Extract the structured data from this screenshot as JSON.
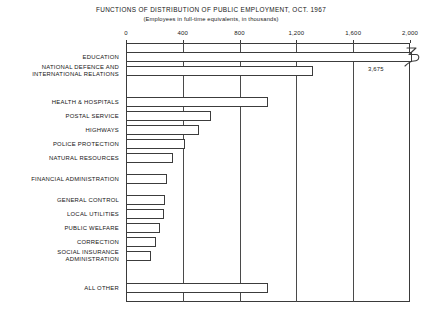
{
  "chart_data": {
    "type": "bar",
    "orientation": "horizontal",
    "title": "FUNCTIONS OF DISTRIBUTION OF PUBLIC EMPLOYMENT, OCT. 1967",
    "subtitle": "(Employees in full-time equivalents, in thousands)",
    "xlabel": "",
    "ylabel": "",
    "xlim": [
      0,
      2000
    ],
    "xticks": [
      0,
      400,
      800,
      1200,
      1600,
      2000
    ],
    "xtick_labels": [
      "0",
      "400",
      "800",
      "1,200",
      "1,600",
      "2,000"
    ],
    "grid": true,
    "legend": null,
    "categories": [
      "EDUCATION",
      "NATIONAL DEFENCE AND\nINTERNATIONAL RELATIONS",
      "HEALTH & HOSPITALS",
      "POSTAL SERVICE",
      "HIGHWAYS",
      "POLICE PROTECTION",
      "NATURAL RESOURCES",
      "FINANCIAL ADMINISTRATION",
      "GENERAL CONTROL",
      "LOCAL UTILITIES",
      "PUBLIC WELFARE",
      "CORRECTION",
      "SOCIAL INSURANCE\nADMINISTRATION",
      "ALL OTHER"
    ],
    "values": [
      3675,
      1320,
      1000,
      600,
      515,
      415,
      330,
      290,
      275,
      265,
      240,
      210,
      175,
      1000
    ],
    "annotations": [
      {
        "category": "EDUCATION",
        "text": "3,675",
        "note": "bar exceeds axis; drawn with squiggle break mark at right edge"
      }
    ]
  }
}
